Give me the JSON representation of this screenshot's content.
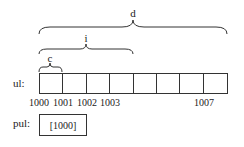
{
  "braces": [
    {
      "label": "d",
      "x1": 39,
      "x2": 227,
      "y": 34,
      "depth": 9
    },
    {
      "label": "i",
      "x1": 39,
      "x2": 133,
      "y": 54,
      "depth": 7
    },
    {
      "label": "c",
      "x1": 39,
      "x2": 62,
      "y": 72,
      "depth": 6
    }
  ],
  "array": {
    "label": "ul:",
    "cell_count": 8,
    "addresses": [
      {
        "text": "1000",
        "index": 0
      },
      {
        "text": "1001",
        "index": 1
      },
      {
        "text": "1002",
        "index": 2
      },
      {
        "text": "1003",
        "index": 3
      },
      {
        "text": "1007",
        "index": 7
      }
    ]
  },
  "pointer": {
    "label": "pul:",
    "value": "[1000]"
  },
  "colors": {
    "stroke": "#333333",
    "text": "#222222",
    "background": "#ffffff"
  }
}
